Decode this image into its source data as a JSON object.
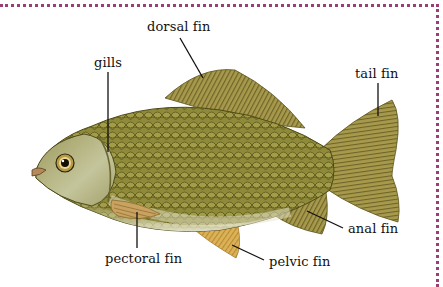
{
  "diagram": {
    "frame_color": "#9a3f76",
    "colors": {
      "body": "#8f8a3a",
      "scale_edge": "#5f5b1e",
      "belly": "#e4e1c4",
      "fin": "#a89a4c",
      "fin_ray": "#6e6428",
      "pelvic_fin": "#d9ad52",
      "head": "#b7b88a"
    },
    "labels": [
      {
        "id": "dorsal_fin",
        "text": "dorsal fin"
      },
      {
        "id": "gills",
        "text": "gills"
      },
      {
        "id": "tail_fin",
        "text": "tail fin"
      },
      {
        "id": "anal_fin",
        "text": "anal fin"
      },
      {
        "id": "pelvic_fin",
        "text": "pelvic fin"
      },
      {
        "id": "pectoral_fin",
        "text": "pectoral fin"
      }
    ]
  }
}
